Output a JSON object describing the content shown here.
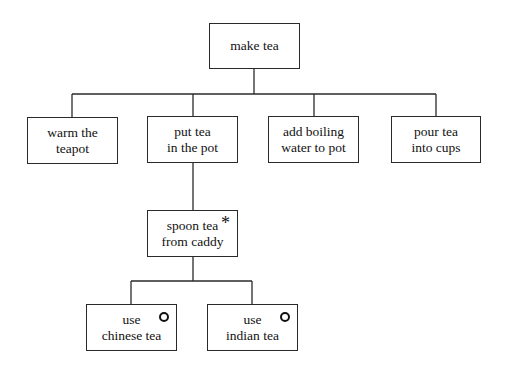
{
  "diagram": {
    "type": "hierarchical task analysis",
    "root": {
      "id": "make-tea",
      "lines": [
        "make tea"
      ]
    },
    "level1": [
      {
        "id": "warm-teapot",
        "lines": [
          "warm the",
          "teapot"
        ]
      },
      {
        "id": "put-tea-in-pot",
        "lines": [
          "put tea",
          "in the pot"
        ]
      },
      {
        "id": "add-boiling-water",
        "lines": [
          "add boiling",
          "water to pot"
        ]
      },
      {
        "id": "pour-tea",
        "lines": [
          "pour tea",
          "into cups"
        ]
      }
    ],
    "level2": [
      {
        "id": "spoon-tea",
        "parent": "put-tea-in-pot",
        "lines": [
          "spoon tea",
          "from caddy"
        ],
        "marker": "*",
        "marker_meaning": "iteration"
      }
    ],
    "level3": [
      {
        "id": "chinese-tea",
        "parent": "spoon-tea",
        "lines": [
          "use",
          "chinese tea"
        ],
        "marker": "o",
        "marker_meaning": "selection"
      },
      {
        "id": "indian-tea",
        "parent": "spoon-tea",
        "lines": [
          "use",
          "indian tea"
        ],
        "marker": "o",
        "marker_meaning": "selection"
      }
    ],
    "colors": {
      "line": "#2a2a2a",
      "box_fill": "#ffffff",
      "text": "#111111"
    }
  }
}
